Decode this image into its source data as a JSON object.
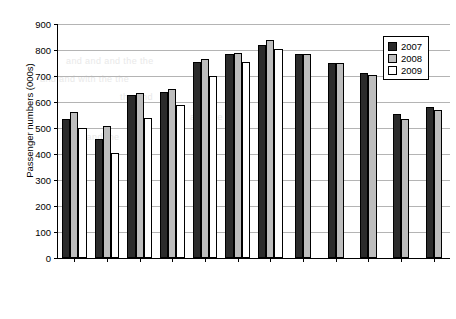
{
  "chart_data": {
    "type": "bar",
    "title": "",
    "xlabel": "",
    "ylabel": "Passenger numbers (000s)",
    "ylim": [
      0,
      900
    ],
    "ytick_step": 100,
    "yticks": [
      0,
      100,
      200,
      300,
      400,
      500,
      600,
      700,
      800,
      900
    ],
    "grid": true,
    "legend_position": "top-right",
    "categories": [
      "January",
      "February",
      "March",
      "April",
      "May",
      "June",
      "July",
      "August",
      "September",
      "October",
      "November",
      "December"
    ],
    "series": [
      {
        "name": "2007",
        "color": "#2b2b2b",
        "values": [
          535,
          458,
          627,
          640,
          752,
          785,
          820,
          785,
          750,
          710,
          555,
          580
        ]
      },
      {
        "name": "2008",
        "color": "#bdbdbd",
        "values": [
          562,
          508,
          633,
          650,
          765,
          790,
          838,
          785,
          750,
          705,
          535,
          570
        ]
      },
      {
        "name": "2009",
        "color": "#ffffff",
        "values": [
          500,
          405,
          540,
          590,
          700,
          755,
          805,
          null,
          null,
          null,
          null,
          null
        ]
      }
    ]
  },
  "legend": {
    "items": [
      {
        "label": "2007",
        "swatch": "swatch-2007"
      },
      {
        "label": "2008",
        "swatch": "swatch-2008"
      },
      {
        "label": "2009",
        "swatch": "swatch-2009"
      }
    ]
  },
  "ghost_text": [
    {
      "text": "and and and the the",
      "x": 66,
      "y": 56
    },
    {
      "text": "and and with the the",
      "x": 40,
      "y": 74
    },
    {
      "text": "the and",
      "x": 120,
      "y": 92
    },
    {
      "text": "and the",
      "x": 190,
      "y": 112
    },
    {
      "text": "the and the",
      "x": 70,
      "y": 132
    }
  ]
}
